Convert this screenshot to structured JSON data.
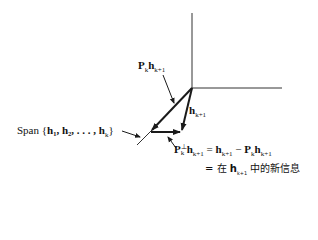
{
  "diagram": {
    "labels": {
      "projection": {
        "main": "P",
        "main_sub": "k",
        "vec": "h",
        "vec_sub": "k+1"
      },
      "h_next": {
        "vec": "h",
        "vec_sub": "k+1"
      },
      "span": {
        "prefix": "Span {",
        "items": "h₁, h₂, . . . , h",
        "items_sub": "k",
        "suffix": "}"
      },
      "perp_line1": {
        "P": "P",
        "sup": "⊥",
        "sub": "k",
        "vec": "h",
        "vec_sub": "k+1",
        "eq": " = ",
        "rhs_h": "h",
        "rhs_h_sub": "k+1",
        "minus": " − ",
        "rhs_P": "P",
        "rhs_P_sub": "k",
        "rhs_vec": "h",
        "rhs_vec_sub": "k+1"
      },
      "perp_line2": {
        "eq": "= 在 ",
        "vec": "h",
        "vec_sub": "k+1",
        "text": " 中的新信息"
      }
    },
    "colors": {
      "line": "#1a1a1a",
      "background": "#ffffff"
    }
  }
}
